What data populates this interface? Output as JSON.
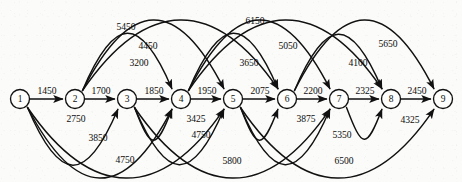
{
  "diagram": {
    "width": 462,
    "height": 182,
    "background_color": "#fbfbf9",
    "line_color": "#111111",
    "node_fill": "#fdfdfb"
  },
  "nodes": [
    {
      "id": "1",
      "label": "1",
      "x": 20,
      "y": 99,
      "r": 9.5
    },
    {
      "id": "2",
      "label": "2",
      "x": 75,
      "y": 99,
      "r": 9.5
    },
    {
      "id": "3",
      "label": "3",
      "x": 127,
      "y": 99,
      "r": 9.5
    },
    {
      "id": "4",
      "label": "4",
      "x": 181,
      "y": 99,
      "r": 9.5
    },
    {
      "id": "5",
      "label": "5",
      "x": 233,
      "y": 99,
      "r": 9.5
    },
    {
      "id": "6",
      "label": "6",
      "x": 287,
      "y": 99,
      "r": 9.5
    },
    {
      "id": "7",
      "label": "7",
      "x": 339,
      "y": 99,
      "r": 9.5
    },
    {
      "id": "8",
      "label": "8",
      "x": 391,
      "y": 99,
      "r": 9.5
    },
    {
      "id": "9",
      "label": "9",
      "x": 443,
      "y": 99,
      "r": 9.5
    }
  ],
  "edges": [
    {
      "from": "1",
      "to": "2",
      "weight": "1450",
      "shape": "straight",
      "label_x": 47,
      "label_y": 90
    },
    {
      "from": "2",
      "to": "3",
      "weight": "1700",
      "shape": "straight",
      "label_x": 101,
      "label_y": 90
    },
    {
      "from": "3",
      "to": "4",
      "weight": "1850",
      "shape": "straight",
      "label_x": 154,
      "label_y": 90
    },
    {
      "from": "4",
      "to": "5",
      "weight": "1950",
      "shape": "straight",
      "label_x": 207,
      "label_y": 90
    },
    {
      "from": "5",
      "to": "6",
      "weight": "2075",
      "shape": "straight",
      "label_x": 260,
      "label_y": 90
    },
    {
      "from": "6",
      "to": "7",
      "weight": "2200",
      "shape": "straight",
      "label_x": 313,
      "label_y": 90
    },
    {
      "from": "7",
      "to": "8",
      "weight": "2325",
      "shape": "straight",
      "label_x": 365,
      "label_y": 90
    },
    {
      "from": "8",
      "to": "9",
      "weight": "2450",
      "shape": "straight",
      "label_x": 417,
      "label_y": 90
    },
    {
      "from": "2",
      "to": "4",
      "weight": "3200",
      "shape": "arc-up",
      "label_x": 139,
      "label_y": 62
    },
    {
      "from": "2",
      "to": "5",
      "weight": "4450",
      "shape": "arc-up",
      "label_x": 148,
      "label_y": 45
    },
    {
      "from": "2",
      "to": "6",
      "weight": "5450",
      "shape": "arc-up",
      "label_x": 126,
      "label_y": 26
    },
    {
      "from": "4",
      "to": "6",
      "weight": "3650",
      "shape": "arc-up",
      "label_x": 249,
      "label_y": 62
    },
    {
      "from": "4",
      "to": "7",
      "weight": "5050",
      "shape": "arc-up",
      "label_x": 288,
      "label_y": 45
    },
    {
      "from": "4",
      "to": "8",
      "weight": "6150",
      "shape": "arc-up",
      "label_x": 255,
      "label_y": 20
    },
    {
      "from": "6",
      "to": "8",
      "weight": "4100",
      "shape": "arc-up",
      "label_x": 358,
      "label_y": 62
    },
    {
      "from": "6",
      "to": "9",
      "weight": "5650",
      "shape": "arc-up",
      "label_x": 388,
      "label_y": 43
    },
    {
      "from": "1",
      "to": "3",
      "weight": "2750",
      "shape": "arc-down",
      "label_x": 76,
      "label_y": 118
    },
    {
      "from": "1",
      "to": "4",
      "weight": "3850",
      "shape": "arc-down",
      "label_x": 98,
      "label_y": 137
    },
    {
      "from": "1",
      "to": "5",
      "weight": "4750",
      "shape": "arc-down",
      "label_x": 125,
      "label_y": 159
    },
    {
      "from": "3",
      "to": "4",
      "weight": "3425",
      "shape": "arc-down",
      "label_x": 196,
      "label_y": 118
    },
    {
      "from": "3",
      "to": "5",
      "weight": "4750",
      "shape": "arc-down",
      "label_x": 201,
      "label_y": 134
    },
    {
      "from": "3",
      "to": "7",
      "weight": "5800",
      "shape": "arc-down",
      "label_x": 232,
      "label_y": 160
    },
    {
      "from": "5",
      "to": "6",
      "weight": "3875",
      "shape": "arc-down",
      "label_x": 306,
      "label_y": 118
    },
    {
      "from": "5",
      "to": "7",
      "weight": "5350",
      "shape": "arc-down",
      "label_x": 342,
      "label_y": 134
    },
    {
      "from": "5",
      "to": "9",
      "weight": "6500",
      "shape": "arc-down",
      "label_x": 344,
      "label_y": 160
    },
    {
      "from": "7",
      "to": "8",
      "weight": "4325",
      "shape": "arc-down",
      "label_x": 410,
      "label_y": 119
    }
  ]
}
